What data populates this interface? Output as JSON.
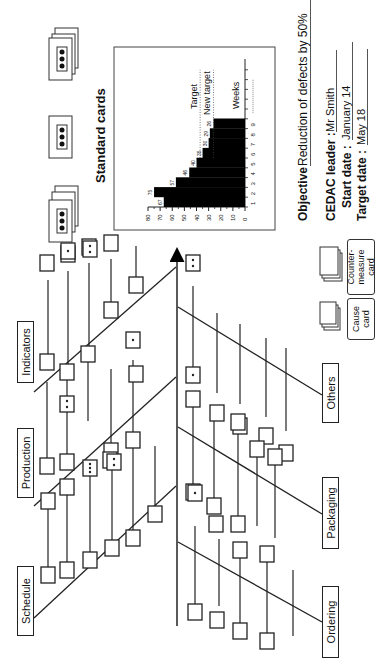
{
  "diagram": {
    "type": "CEDAC fishbone (cause-and-effect with cards)",
    "orientation": "rotated 90deg counter-clockwise",
    "categories_top": [
      "Schedule",
      "Production",
      "Indicators"
    ],
    "categories_bottom": [
      "Ordering",
      "Packaging",
      "Others"
    ]
  },
  "standard_cards": {
    "title": "Standard cards",
    "cards": [
      {
        "type": "stacked",
        "dots": 3
      },
      {
        "type": "single",
        "dots": 3
      },
      {
        "type": "stacked",
        "dots": 3
      }
    ]
  },
  "legend": {
    "cause_card": "Cause card",
    "cause_card_line1": "Cause",
    "cause_card_line2": "card",
    "countermeasure_card": "Counter-measure card",
    "countermeasure_line1": "Counter-",
    "countermeasure_line2": "measure card"
  },
  "info": {
    "objective_label": "Objective",
    "objective_value": "Reduction of defects by 50%",
    "leader_label": "CEDAC leader :",
    "leader_value": "Mr Smith",
    "start_label": "Start date :",
    "start_value": "January 14",
    "target_label": "Target date :",
    "target_value": "May 18"
  },
  "chart_data": {
    "type": "bar",
    "title": "",
    "xlabel": "Weeks",
    "ylabel": "",
    "categories": [
      "1",
      "2",
      "3",
      "4",
      "5",
      "6",
      "7",
      "8",
      "9"
    ],
    "values": [
      67,
      75,
      57,
      46,
      40,
      35,
      30,
      29,
      26
    ],
    "data_labels": [
      "67",
      "75",
      "57",
      "46",
      "40",
      "35",
      "30",
      "29",
      "26"
    ],
    "ylim": [
      0,
      80
    ],
    "yticks": [
      "0",
      "10",
      "20",
      "30",
      "40",
      "50",
      "60",
      "70",
      "80"
    ],
    "x_ticks_extra": 5,
    "annotations": [
      {
        "label": "Target",
        "value": 37,
        "style": "dotted"
      },
      {
        "label": "New target",
        "value": 26,
        "style": "dotted"
      }
    ],
    "style": "step bars, black fill",
    "grid": false,
    "legend": "none"
  },
  "colors": {
    "line": "#222222",
    "fill": "#000000",
    "background": "#ffffff"
  }
}
